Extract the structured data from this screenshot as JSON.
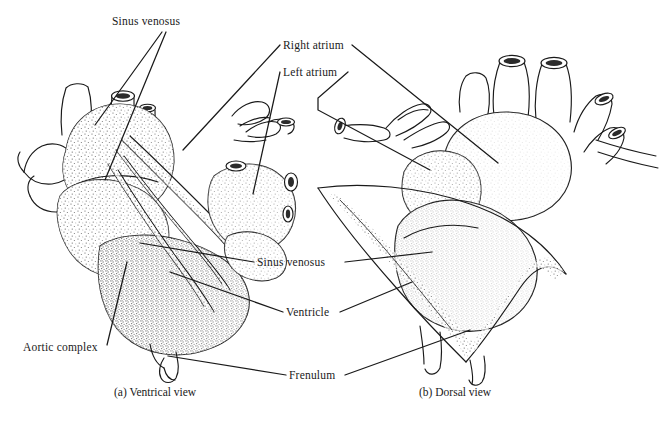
{
  "figure": {
    "background_color": "#ffffff",
    "ink_color": "#1a1a1a",
    "width": 665,
    "height": 421
  },
  "labels": {
    "sinus_venosus_top": "Sinus venosus",
    "right_atrium": "Right atrium",
    "left_atrium": "Left atrium",
    "sinus_venosus_middle": "Sinus venosus",
    "ventricle": "Ventricle",
    "frenulum": "Frenulum",
    "aortic_complex": "Aortic complex"
  },
  "captions": {
    "panel_a": "(a) Ventrical view",
    "panel_b": "(b) Dorsal view"
  },
  "panels": [
    {
      "id": "a",
      "caption": "(a) Ventrical view",
      "view": "ventral"
    },
    {
      "id": "b",
      "caption": "(b) Dorsal view",
      "view": "dorsal"
    }
  ],
  "annotations": [
    {
      "label": "Sinus venosus",
      "panel": "a",
      "leaders": 2
    },
    {
      "label": "Right atrium",
      "panel": "a",
      "leaders": 1
    },
    {
      "label": "Right atrium",
      "panel": "b",
      "leaders": 1
    },
    {
      "label": "Left atrium",
      "panel": "a",
      "leaders": 1
    },
    {
      "label": "Left atrium",
      "panel": "b",
      "leaders": 1
    },
    {
      "label": "Sinus venosus",
      "panel": "b",
      "leaders": 1
    },
    {
      "label": "Ventricle",
      "panel": "a",
      "leaders": 1
    },
    {
      "label": "Ventricle",
      "panel": "b",
      "leaders": 1
    },
    {
      "label": "Frenulum",
      "panel": "a",
      "leaders": 1
    },
    {
      "label": "Frenulum",
      "panel": "b",
      "leaders": 1
    },
    {
      "label": "Aortic complex",
      "panel": "a",
      "leaders": 1
    }
  ]
}
